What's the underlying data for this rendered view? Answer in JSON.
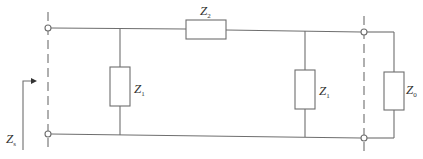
{
  "diagram": {
    "type": "circuit",
    "colors": {
      "line": "#6e6e6e",
      "text": "#333333",
      "background": "#ffffff"
    },
    "components": [
      {
        "id": "shunt-left",
        "label": "Z",
        "subscript": "1"
      },
      {
        "id": "series",
        "label": "Z",
        "subscript": "2"
      },
      {
        "id": "shunt-right",
        "label": "Z",
        "subscript": "1"
      },
      {
        "id": "load",
        "label": "Z",
        "subscript": "0"
      }
    ],
    "input_impedance": {
      "label": "Z",
      "subscript": "s"
    }
  }
}
